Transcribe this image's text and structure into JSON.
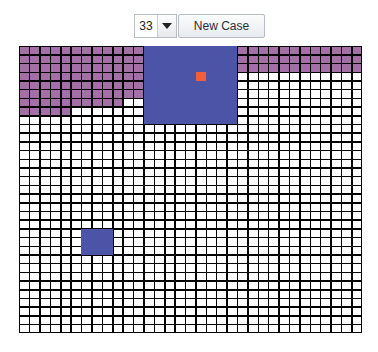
{
  "toolbar": {
    "size_select": {
      "value": "33",
      "icon": "chevron-down-icon"
    },
    "new_case_label": "New Case"
  },
  "board": {
    "rows": 33,
    "cols": 33,
    "colors": {
      "empty": "#ffffff",
      "filled": "#a46fa6",
      "grid": "#000000",
      "block": "#4b54a6",
      "marker": "#ef5f3c"
    },
    "filled_runs": [
      {
        "row": 0,
        "col_start": 0,
        "col_end": 11
      },
      {
        "row": 1,
        "col_start": 0,
        "col_end": 11
      },
      {
        "row": 2,
        "col_start": 0,
        "col_end": 11
      },
      {
        "row": 3,
        "col_start": 0,
        "col_end": 11
      },
      {
        "row": 4,
        "col_start": 0,
        "col_end": 11
      },
      {
        "row": 5,
        "col_start": 0,
        "col_end": 11
      },
      {
        "row": 6,
        "col_start": 0,
        "col_end": 9
      },
      {
        "row": 7,
        "col_start": 0,
        "col_end": 4
      },
      {
        "row": 0,
        "col_start": 21,
        "col_end": 32
      },
      {
        "row": 1,
        "col_start": 21,
        "col_end": 32
      },
      {
        "row": 2,
        "col_start": 21,
        "col_end": 32
      }
    ],
    "blocks": [
      {
        "name": "large-block",
        "row": 0,
        "col": 12,
        "rows": 9,
        "cols": 9
      },
      {
        "name": "small-block",
        "row": 21,
        "col": 6,
        "rows": 3,
        "cols": 3
      }
    ],
    "marker": {
      "row": 3,
      "col": 17
    }
  }
}
